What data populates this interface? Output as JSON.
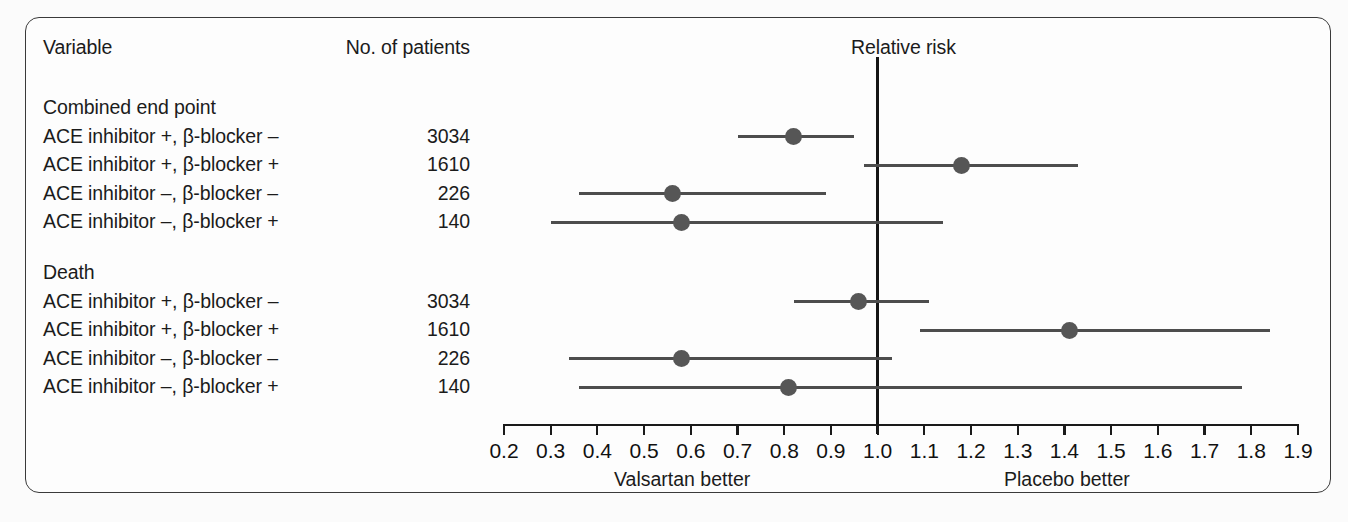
{
  "figure": {
    "columns": {
      "variable_header": "Variable",
      "patients_header": "No. of patients",
      "plot_header": "Relative risk"
    },
    "footer": {
      "left_label": "Valsartan better",
      "right_label": "Placebo better"
    },
    "groups": [
      {
        "title": "Combined end point",
        "rows": [
          {
            "label": "ACE inhibitor +, β-blocker –",
            "patients": "3034"
          },
          {
            "label": "ACE inhibitor +, β-blocker +",
            "patients": "1610"
          },
          {
            "label": "ACE inhibitor –, β-blocker –",
            "patients": "226"
          },
          {
            "label": "ACE inhibitor –, β-blocker +",
            "patients": "140"
          }
        ]
      },
      {
        "title": "Death",
        "rows": [
          {
            "label": "ACE inhibitor +, β-blocker –",
            "patients": "3034"
          },
          {
            "label": "ACE inhibitor +, β-blocker +",
            "patients": "1610"
          },
          {
            "label": "ACE inhibitor –, β-blocker –",
            "patients": "226"
          },
          {
            "label": "ACE inhibitor –, β-blocker +",
            "patients": "140"
          }
        ]
      }
    ]
  },
  "chart_data": {
    "type": "scatter",
    "subtype": "forest-plot",
    "title": "Relative risk",
    "xlabel": "Relative risk",
    "ylabel": "",
    "xlim": [
      0.2,
      1.9
    ],
    "xticks": [
      "0.2",
      "0.3",
      "0.4",
      "0.5",
      "0.6",
      "0.7",
      "0.8",
      "0.9",
      "1.0",
      "1.1",
      "1.2",
      "1.3",
      "1.4",
      "1.5",
      "1.6",
      "1.7",
      "1.8",
      "1.9"
    ],
    "xtick_values": [
      0.2,
      0.3,
      0.4,
      0.5,
      0.6,
      0.7,
      0.8,
      0.9,
      1.0,
      1.1,
      1.2,
      1.3,
      1.4,
      1.5,
      1.6,
      1.7,
      1.8,
      1.9
    ],
    "grid": false,
    "legend": "none",
    "reference_line": 1.0,
    "annotations": [
      "Valsartan better",
      "Placebo better"
    ],
    "point_color": "#565656",
    "line_color": "#4d4d4d",
    "reference_color": "#151515",
    "points": [
      {
        "group": "Combined end point",
        "label": "ACE inhibitor +, β-blocker –",
        "patients": 3034,
        "estimate": 0.82,
        "ci_low": 0.7,
        "ci_high": 0.95
      },
      {
        "group": "Combined end point",
        "label": "ACE inhibitor +, β-blocker +",
        "patients": 1610,
        "estimate": 1.18,
        "ci_low": 0.97,
        "ci_high": 1.43
      },
      {
        "group": "Combined end point",
        "label": "ACE inhibitor –, β-blocker –",
        "patients": 226,
        "estimate": 0.56,
        "ci_low": 0.36,
        "ci_high": 0.89
      },
      {
        "group": "Combined end point",
        "label": "ACE inhibitor –, β-blocker +",
        "patients": 140,
        "estimate": 0.58,
        "ci_low": 0.3,
        "ci_high": 1.14
      },
      {
        "group": "Death",
        "label": "ACE inhibitor +, β-blocker –",
        "patients": 3034,
        "estimate": 0.96,
        "ci_low": 0.82,
        "ci_high": 1.11
      },
      {
        "group": "Death",
        "label": "ACE inhibitor +, β-blocker +",
        "patients": 1610,
        "estimate": 1.41,
        "ci_low": 1.09,
        "ci_high": 1.84
      },
      {
        "group": "Death",
        "label": "ACE inhibitor –, β-blocker –",
        "patients": 226,
        "estimate": 0.58,
        "ci_low": 0.34,
        "ci_high": 1.03
      },
      {
        "group": "Death",
        "label": "ACE inhibitor –, β-blocker +",
        "patients": 140,
        "estimate": 0.81,
        "ci_low": 0.36,
        "ci_high": 1.78
      }
    ]
  }
}
